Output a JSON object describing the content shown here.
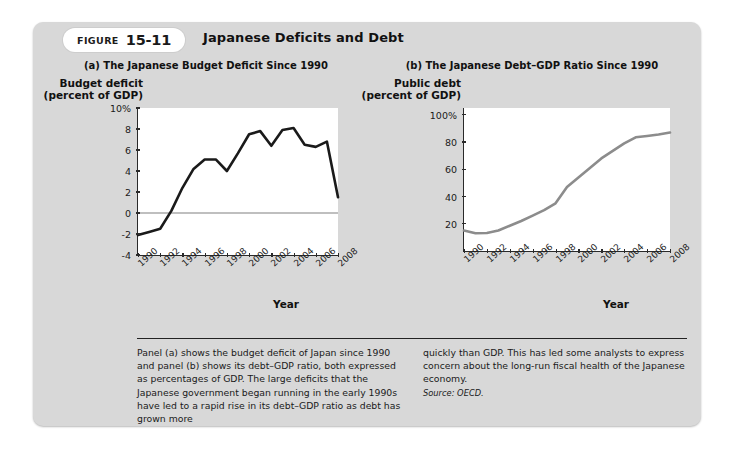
{
  "figure": {
    "label_word": "FIGURE",
    "number": "15-11",
    "title": "Japanese Deficits and Debt"
  },
  "caption": {
    "left_text": "Panel (a) shows the budget deficit of Japan since 1990 and panel (b) shows its debt–GDP ratio, both expressed as percentages of GDP. The large deficits that the Japanese government began running in the early 1990s have led to a rapid rise in its debt–GDP ratio as debt has grown more",
    "right_text": "quickly than GDP. This has led some analysts to express concern about the long-run fiscal health of the Japanese economy.",
    "source": "Source: OECD."
  },
  "colors": {
    "panel_background": "#d8d8d8",
    "plot_background": "#ffffff",
    "axis": "#2a2a2a",
    "series_a_line": "#1a1a1a",
    "series_b_line": "#8c8c8c",
    "zero_line": "#808080"
  },
  "chart_data": [
    {
      "type": "line",
      "id": "panel-a",
      "title": "(a) The Japanese Budget Deficit Since 1990",
      "ylabel": "Budget deficit (percent of GDP)",
      "xlabel": "Year",
      "ylim": [
        -4,
        10
      ],
      "xlim": [
        1990,
        2008
      ],
      "grid": false,
      "legend": "none",
      "ytick_labels": [
        "10%",
        "8",
        "6",
        "4",
        "2",
        "0",
        "-2",
        "-4"
      ],
      "ytick_values": [
        10,
        8,
        6,
        4,
        2,
        0,
        -2,
        -4
      ],
      "xtick_labels": [
        "1990",
        "1992",
        "1994",
        "1996",
        "1998",
        "2000",
        "2002",
        "2004",
        "2006",
        "2008"
      ],
      "xtick_values": [
        1990,
        1992,
        1994,
        1996,
        1998,
        2000,
        2002,
        2004,
        2006,
        2008
      ],
      "zero_line": 0,
      "x": [
        1990,
        1991,
        1992,
        1993,
        1994,
        1995,
        1996,
        1997,
        1998,
        1999,
        2000,
        2001,
        2002,
        2003,
        2004,
        2005,
        2006,
        2007,
        2008
      ],
      "values": [
        -2.1,
        -1.8,
        -1.5,
        0.2,
        2.4,
        4.2,
        5.1,
        5.1,
        4.0,
        5.7,
        7.5,
        7.8,
        6.4,
        7.9,
        8.1,
        6.5,
        6.3,
        6.8,
        1.5
      ],
      "series_name": "Budget deficit (percent of GDP)"
    },
    {
      "type": "line",
      "id": "panel-b",
      "title": "(b) The Japanese Debt–GDP Ratio Since 1990",
      "ylabel": "Public debt (percent of GDP)",
      "xlabel": "Year",
      "ylim": [
        0,
        105
      ],
      "xlim": [
        1990,
        2008
      ],
      "grid": false,
      "legend": "none",
      "ytick_labels": [
        "100%",
        "80",
        "60",
        "40",
        "20"
      ],
      "ytick_values": [
        100,
        80,
        60,
        40,
        20
      ],
      "xtick_labels": [
        "1990",
        "1992",
        "1994",
        "1996",
        "1998",
        "2000",
        "2002",
        "2004",
        "2006",
        "2008"
      ],
      "xtick_values": [
        1990,
        1992,
        1994,
        1996,
        1998,
        2000,
        2002,
        2004,
        2006,
        2008
      ],
      "x": [
        1990,
        1991,
        1992,
        1993,
        1994,
        1995,
        1996,
        1997,
        1998,
        1999,
        2000,
        2001,
        2002,
        2003,
        2004,
        2005,
        2006,
        2007,
        2008
      ],
      "values": [
        15.0,
        13.0,
        13.2,
        15.0,
        18.5,
        22.0,
        26.0,
        30.0,
        35.0,
        47.0,
        54.0,
        61.0,
        68.0,
        73.5,
        79.0,
        83.5,
        84.5,
        85.5,
        87.0
      ],
      "series_name": "Public debt (percent of GDP)"
    }
  ]
}
